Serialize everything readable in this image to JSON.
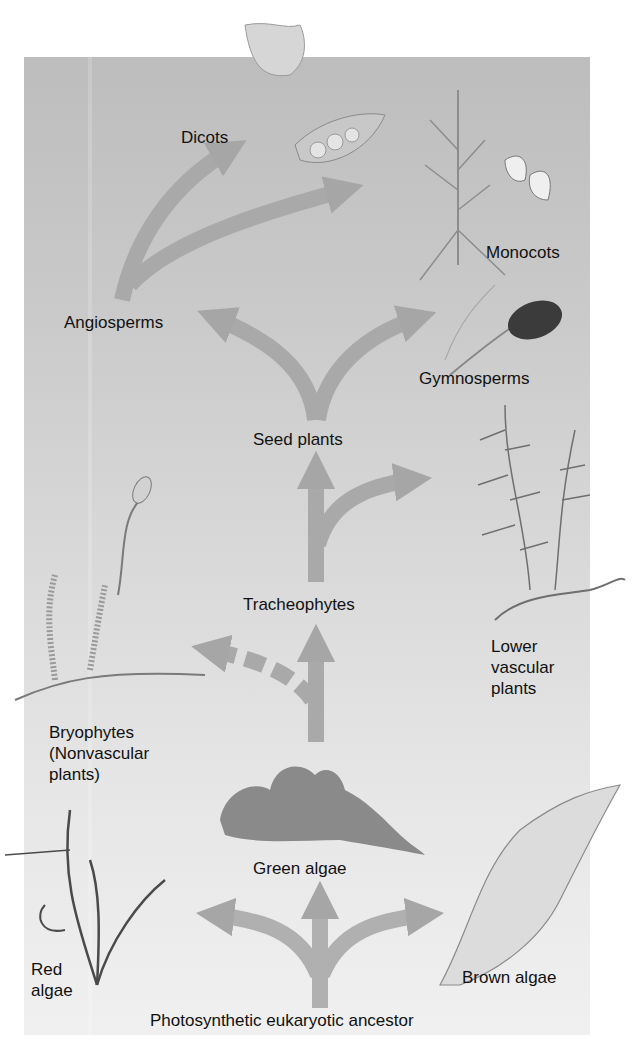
{
  "diagram": {
    "type": "phylogenetic-tree",
    "root": "Photosynthetic eukaryotic ancestor",
    "labels": {
      "dicots": "Dicots",
      "monocots": "Monocots",
      "angiosperms": "Angiosperms",
      "gymnosperms": "Gymnosperms",
      "seed_plants": "Seed plants",
      "tracheophytes": "Tracheophytes",
      "lower_vascular": [
        "Lower",
        "vascular",
        "plants"
      ],
      "bryophytes": [
        "Bryophytes",
        "(Nonvascular",
        "plants)"
      ],
      "green_algae": "Green algae",
      "red_algae": [
        "Red",
        "algae"
      ],
      "brown_algae": "Brown algae",
      "ancestor": "Photosynthetic eukaryotic ancestor"
    },
    "branches": [
      {
        "from": "Photosynthetic eukaryotic ancestor",
        "to": [
          "Red algae",
          "Green algae",
          "Brown algae"
        ]
      },
      {
        "from": "Green algae",
        "to": [
          "Bryophytes (Nonvascular plants)",
          "Tracheophytes"
        ],
        "dashed": "Bryophytes (Nonvascular plants)"
      },
      {
        "from": "Tracheophytes",
        "to": [
          "Seed plants",
          "Lower vascular plants"
        ]
      },
      {
        "from": "Seed plants",
        "to": [
          "Angiosperms",
          "Gymnosperms"
        ]
      },
      {
        "from": "Angiosperms",
        "to": [
          "Dicots",
          "Monocots"
        ]
      }
    ],
    "illustrations": [
      "flower-pea-pod",
      "corn-plant-kernels",
      "pine-cone-branch",
      "fern",
      "moss-sporophyte",
      "green-algae-thallus",
      "red-algae-frond",
      "brown-algae-kelp"
    ],
    "colors": {
      "panel_top": "#bdbdbd",
      "panel_bottom": "#f0f0f0",
      "arrow": "#a8a8a8",
      "text": "#111111"
    }
  }
}
